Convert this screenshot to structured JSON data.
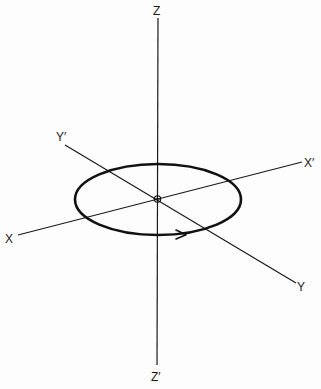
{
  "figure": {
    "type": "3d-axes-diagram",
    "axes": {
      "z_positive": "Z",
      "z_negative": "Z′",
      "x_positive": "X",
      "x_negative": "X′",
      "y_positive": "Y",
      "y_negative": "Y′"
    },
    "orbit": {
      "shape": "ellipse",
      "plane": "X-Y",
      "direction_arrow": "right (along near side of orbit)"
    },
    "origin_marker": "small circle with cross"
  },
  "colors": {
    "ink": "#111111",
    "paper": "#fdfdfd"
  }
}
